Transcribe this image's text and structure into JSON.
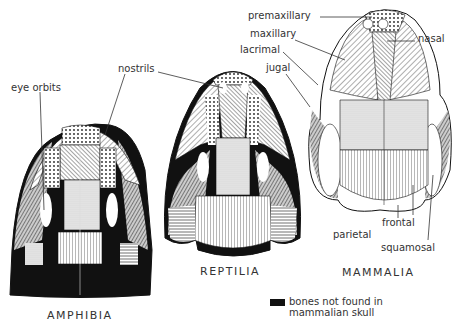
{
  "figure": {
    "skulls": [
      {
        "name": "amphibia",
        "caption": "AMPHIBIA"
      },
      {
        "name": "reptilia",
        "caption": "REPTILIA"
      },
      {
        "name": "mammalia",
        "caption": "MAMMALIA"
      }
    ],
    "labels": {
      "eye_orbits": "eye orbits",
      "nostrils": "nostrils",
      "premaxillary": "premaxillary",
      "maxillary": "maxillary",
      "lacrimal": "lacrimal",
      "jugal": "jugal",
      "nasal": "nasal",
      "frontal": "frontal",
      "parietal": "parietal",
      "squamosal": "squamosal"
    },
    "legend": {
      "line1": "bones not found in",
      "line2": "mammalian skull",
      "swatch_color": "#111111"
    }
  }
}
